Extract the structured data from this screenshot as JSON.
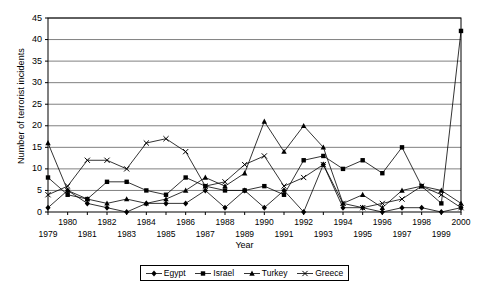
{
  "chart_data": {
    "type": "line",
    "title": "",
    "xlabel": "Year",
    "ylabel": "Number of terrorist incidents",
    "x": [
      1979,
      1980,
      1981,
      1982,
      1983,
      1984,
      1985,
      1986,
      1987,
      1988,
      1989,
      1990,
      1991,
      1992,
      1993,
      1994,
      1995,
      1996,
      1997,
      1998,
      1999,
      2000
    ],
    "categories": [
      "1979",
      "1980",
      "1981",
      "1982",
      "1983",
      "1984",
      "1985",
      "1986",
      "1987",
      "1988",
      "1989",
      "1990",
      "1991",
      "1992",
      "1993",
      "1994",
      "1995",
      "1996",
      "1997",
      "1998",
      "1999",
      "2000"
    ],
    "xlim": [
      1979,
      2000
    ],
    "ylim": [
      0,
      45
    ],
    "ytick_step": 5,
    "yticks": [
      0,
      5,
      10,
      15,
      20,
      25,
      30,
      35,
      40,
      45
    ],
    "grid": true,
    "legend_position": "bottom",
    "series": [
      {
        "name": "Egypt",
        "marker": "diamond",
        "values": [
          1,
          5,
          2,
          1,
          0,
          2,
          2,
          2,
          5,
          1,
          5,
          1,
          5,
          0,
          11,
          1,
          1,
          0,
          1,
          1,
          0,
          1
        ]
      },
      {
        "name": "Israel",
        "marker": "square",
        "values": [
          8,
          4,
          3,
          7,
          7,
          5,
          4,
          8,
          6,
          5,
          5,
          6,
          4,
          12,
          13,
          10,
          12,
          9,
          15,
          6,
          2,
          42
        ]
      },
      {
        "name": "Turkey",
        "marker": "triangle",
        "values": [
          16,
          5,
          3,
          2,
          3,
          2,
          3,
          5,
          8,
          6,
          9,
          21,
          14,
          20,
          15,
          2,
          4,
          1,
          5,
          6,
          5,
          2
        ]
      },
      {
        "name": "Greece",
        "marker": "cross",
        "values": [
          4,
          6,
          12,
          12,
          10,
          16,
          17,
          14,
          6,
          7,
          11,
          13,
          6,
          8,
          11,
          2,
          1,
          2,
          3,
          6,
          4,
          1
        ]
      }
    ]
  },
  "axes": {
    "ylabel": "Number of terrorist incidents",
    "xlabel": "Year"
  },
  "legend": {
    "items": [
      {
        "label": "Egypt",
        "marker": "diamond-marker-icon"
      },
      {
        "label": "Israel",
        "marker": "square-marker-icon"
      },
      {
        "label": "Turkey",
        "marker": "triangle-marker-icon"
      },
      {
        "label": "Greece",
        "marker": "cross-marker-icon"
      }
    ]
  },
  "style": {
    "line_color": "#000000",
    "grid_color": "#808080",
    "axis_color": "#000000",
    "background": "#ffffff"
  }
}
